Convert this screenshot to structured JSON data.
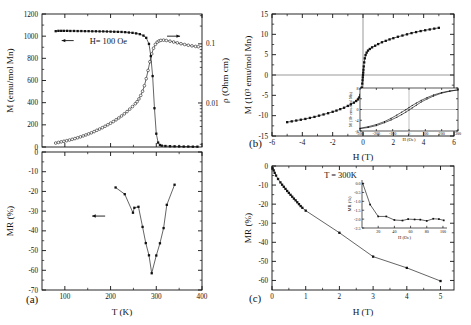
{
  "figure": {
    "title": "",
    "panels": [
      "a",
      "b",
      "c"
    ]
  },
  "panel_a_top": {
    "label": "",
    "annotation": "H= 100 Oe",
    "left_arrow_icon": "left-arrow-icon",
    "right_arrow_icon": "right-arrow-icon"
  },
  "panel_a_bottom": {
    "label": "(a)"
  },
  "panel_b": {
    "label": "(b)"
  },
  "panel_c": {
    "label": "(c)",
    "annotation": "T = 300K"
  },
  "chart_data": [
    {
      "id": "panel-a-top",
      "type": "line",
      "title": "",
      "xlabel": "",
      "ylabel": "M (emu/mol Mn)",
      "y2label": "ρ (Ohm cm)",
      "xlim": [
        50,
        400
      ],
      "ylim": [
        0,
        1200
      ],
      "y2lim": [
        0.0018,
        0.32
      ],
      "y2scale": "log",
      "xticks": [
        100,
        200,
        300,
        400
      ],
      "yticks": [
        0,
        200,
        400,
        600,
        800,
        1000,
        1200
      ],
      "y2ticks": [
        0.01,
        0.1
      ],
      "grid": false,
      "annotations": [
        {
          "text": "H= 100 Oe",
          "x": 150,
          "y": 960,
          "arrow": "left"
        },
        {
          "text": "",
          "x": 352,
          "y": 1090,
          "arrow": "right"
        }
      ],
      "series": [
        {
          "name": "M vs T (H = 100 Oe)",
          "axis": "left",
          "marker": "square-filled",
          "x": [
            80,
            86,
            92,
            98,
            105,
            112,
            120,
            128,
            136,
            144,
            152,
            160,
            168,
            176,
            184,
            192,
            200,
            208,
            216,
            224,
            232,
            240,
            248,
            256,
            264,
            272,
            278,
            284,
            288,
            292,
            296,
            300,
            304,
            308,
            312,
            320,
            330,
            340,
            350,
            360,
            370,
            380,
            390
          ],
          "y": [
            1045,
            1048,
            1048,
            1048,
            1048,
            1047,
            1047,
            1046,
            1046,
            1045,
            1045,
            1044,
            1044,
            1043,
            1043,
            1042,
            1041,
            1040,
            1039,
            1038,
            1036,
            1033,
            1030,
            1025,
            1018,
            1005,
            985,
            930,
            820,
            640,
            350,
            120,
            40,
            18,
            12,
            9,
            7,
            6,
            5,
            4,
            4,
            3,
            3
          ]
        },
        {
          "name": "rho vs T",
          "axis": "right",
          "marker": "circle-open",
          "x": [
            80,
            86,
            92,
            98,
            104,
            110,
            116,
            122,
            128,
            134,
            140,
            146,
            152,
            158,
            164,
            170,
            176,
            182,
            188,
            194,
            200,
            206,
            212,
            218,
            224,
            230,
            236,
            242,
            248,
            254,
            258,
            262,
            266,
            270,
            274,
            278,
            282,
            286,
            290,
            294,
            298,
            302,
            306,
            310,
            316,
            322,
            330,
            338,
            346,
            354,
            362,
            370,
            378,
            386,
            392
          ],
          "y": [
            0.0021,
            0.00215,
            0.0022,
            0.00225,
            0.0023,
            0.00236,
            0.00243,
            0.0025,
            0.00258,
            0.00267,
            0.00277,
            0.00288,
            0.003,
            0.00313,
            0.00328,
            0.00345,
            0.00362,
            0.00382,
            0.00404,
            0.00428,
            0.00455,
            0.00485,
            0.00519,
            0.00558,
            0.00603,
            0.00655,
            0.00715,
            0.00787,
            0.0087,
            0.0097,
            0.0105,
            0.0117,
            0.0134,
            0.0158,
            0.0196,
            0.0258,
            0.0355,
            0.0498,
            0.0675,
            0.0845,
            0.098,
            0.107,
            0.112,
            0.1145,
            0.1155,
            0.114,
            0.111,
            0.1075,
            0.104,
            0.1005,
            0.0975,
            0.0948,
            0.0925,
            0.0905,
            0.0895
          ]
        }
      ]
    },
    {
      "id": "panel-a-bottom",
      "type": "line",
      "title": "",
      "xlabel": "T (K)",
      "ylabel": "MR (%)",
      "xlim": [
        50,
        400
      ],
      "ylim": [
        -70,
        0
      ],
      "xticks": [
        100,
        200,
        300,
        400
      ],
      "yticks": [
        0,
        -10,
        -20,
        -30,
        -40,
        -50,
        -60,
        -70
      ],
      "grid": false,
      "annotations": [
        {
          "text": "",
          "x": 175,
          "y": -32.5,
          "arrow": "left"
        }
      ],
      "series": [
        {
          "name": "MR vs T",
          "axis": "left",
          "marker": "square-filled",
          "x": [
            211,
            231,
            249,
            252,
            261,
            270,
            277,
            284,
            290,
            300,
            308,
            316,
            323,
            340
          ],
          "y": [
            -18.0,
            -21.4,
            -30.8,
            -28.3,
            -27.8,
            -38.0,
            -46.2,
            -52.4,
            -61.5,
            -52.5,
            -46.3,
            -38.6,
            -26.8,
            -16.6
          ]
        }
      ]
    },
    {
      "id": "panel-b",
      "type": "line",
      "title": "",
      "xlabel": "H (T)",
      "ylabel": "M (10³ emu/mol Mn)",
      "xlim": [
        -6,
        6
      ],
      "ylim": [
        -15,
        15
      ],
      "xticks": [
        -6,
        -4,
        -2,
        0,
        2,
        4,
        6
      ],
      "yticks": [
        -15,
        -10,
        -5,
        0,
        5,
        10,
        15
      ],
      "grid": false,
      "zero_lines": true,
      "series": [
        {
          "name": "M vs H",
          "axis": "left",
          "marker": "square-filled",
          "x": [
            -5.0,
            -4.7,
            -4.4,
            -4.1,
            -3.8,
            -3.5,
            -3.2,
            -2.9,
            -2.6,
            -2.3,
            -2.0,
            -1.75,
            -1.5,
            -1.25,
            -1.0,
            -0.8,
            -0.6,
            -0.45,
            -0.33,
            -0.24,
            -0.17,
            -0.12,
            -0.08,
            -0.05,
            -0.03,
            -0.015,
            0,
            0.015,
            0.03,
            0.05,
            0.08,
            0.12,
            0.17,
            0.24,
            0.33,
            0.45,
            0.6,
            0.8,
            1.0,
            1.25,
            1.5,
            1.75,
            2.0,
            2.3,
            2.6,
            2.9,
            3.2,
            3.5,
            3.8,
            4.1,
            4.4,
            4.7,
            5.0
          ],
          "y": [
            -11.6,
            -11.4,
            -11.2,
            -11.0,
            -10.8,
            -10.55,
            -10.3,
            -10.0,
            -9.7,
            -9.4,
            -9.05,
            -8.75,
            -8.4,
            -8.05,
            -7.6,
            -7.2,
            -6.8,
            -6.4,
            -6.0,
            -5.5,
            -4.9,
            -4.1,
            -3.1,
            -2.1,
            -1.3,
            -0.6,
            0.0,
            0.6,
            1.3,
            2.1,
            3.1,
            4.1,
            4.9,
            5.5,
            6.0,
            6.4,
            6.8,
            7.2,
            7.6,
            8.05,
            8.4,
            8.75,
            9.05,
            9.4,
            9.7,
            10.0,
            10.3,
            10.55,
            10.8,
            11.0,
            11.2,
            11.4,
            11.6
          ]
        }
      ],
      "inset": {
        "xlabel": "H (Oe)",
        "ylabel": "M (10³ emu/mol Mn)",
        "xlim": [
          -300,
          300
        ],
        "ylim": [
          -8,
          8
        ],
        "xticks": [
          -300,
          -200,
          -100,
          0,
          100,
          200,
          300
        ],
        "yticks": [
          -8,
          -4,
          0,
          4,
          8
        ],
        "zero_lines": true,
        "series": [
          {
            "name": "hysteresis-loop",
            "x": [
              -300,
              -250,
              -200,
              -150,
              -110,
              -75,
              -45,
              -20,
              0,
              20,
              45,
              75,
              110,
              150,
              200,
              250,
              300
            ],
            "y": [
              -7.0,
              -6.4,
              -5.6,
              -4.5,
              -3.3,
              -2.1,
              -1.0,
              -0.1,
              0.7,
              1.5,
              2.4,
              3.4,
              4.4,
              5.4,
              6.3,
              6.9,
              7.3
            ]
          },
          {
            "name": "hysteresis-loop-return",
            "x": [
              300,
              250,
              200,
              150,
              110,
              75,
              45,
              20,
              0,
              -20,
              -45,
              -75,
              -110,
              -150,
              -200,
              -250,
              -300
            ],
            "y": [
              7.3,
              6.8,
              6.1,
              5.0,
              3.9,
              2.8,
              1.6,
              0.6,
              -0.2,
              -1.0,
              -1.9,
              -2.9,
              -3.9,
              -4.9,
              -6.0,
              -6.7,
              -7.1
            ]
          }
        ]
      }
    },
    {
      "id": "panel-c",
      "type": "line",
      "title": "",
      "xlabel": "H (T)",
      "ylabel": "MR (%)",
      "xlim": [
        0,
        5.4
      ],
      "ylim": [
        -65,
        0
      ],
      "xticks": [
        0,
        1,
        2,
        3,
        4,
        5
      ],
      "yticks": [
        0,
        -10,
        -20,
        -30,
        -40,
        -50,
        -60
      ],
      "grid": false,
      "annotations": [
        {
          "text": "T = 300K",
          "x": 1.55,
          "y": -6.5,
          "arrow": "none"
        }
      ],
      "series": [
        {
          "name": "MR vs H at 300K",
          "axis": "left",
          "marker": "square-filled",
          "x": [
            0.02,
            0.05,
            0.08,
            0.12,
            0.18,
            0.25,
            0.3,
            0.35,
            0.4,
            0.45,
            0.5,
            0.55,
            0.6,
            0.65,
            0.7,
            0.75,
            0.8,
            0.85,
            0.9,
            1.0,
            2.0,
            3.0,
            4.0,
            5.0
          ],
          "y": [
            -1.2,
            -2.3,
            -3.6,
            -5.0,
            -6.8,
            -8.6,
            -9.8,
            -10.9,
            -12.0,
            -13.1,
            -14.1,
            -15.1,
            -16.1,
            -17.1,
            -18.0,
            -19.0,
            -20.0,
            -21.0,
            -21.9,
            -23.4,
            -35.0,
            -47.5,
            -53.4,
            -60.3
          ]
        }
      ],
      "inset": {
        "xlabel": "H (Oe)",
        "ylabel": "MR (%)",
        "xlim": [
          0,
          105
        ],
        "ylim": [
          -2.5,
          0.2
        ],
        "xticks": [
          20,
          40,
          60,
          80,
          100
        ],
        "yticks": [
          0.0,
          -0.5,
          -1.0,
          -1.5,
          -2.0,
          -2.5
        ],
        "ytick_labels": [
          "0.0",
          "-0.5",
          "-1.0",
          "-1.5",
          "-2.0",
          "-2.5"
        ],
        "series": [
          {
            "name": "low-field-MR",
            "x": [
              1,
              10,
              20,
              30,
              40,
              50,
              57,
              65,
              72,
              80,
              88,
              95,
              101
            ],
            "y": [
              0.0,
              -1.18,
              -1.85,
              -1.85,
              -2.05,
              -2.08,
              -2.0,
              -2.02,
              -2.03,
              -2.1,
              -1.98,
              -2.0,
              -2.07
            ]
          }
        ]
      }
    }
  ]
}
